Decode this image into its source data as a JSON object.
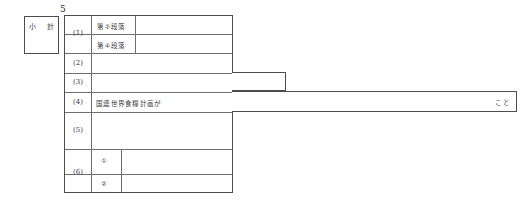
{
  "sheet": {
    "subtotal": {
      "label": "小  計"
    },
    "question_number": "5",
    "rows": [
      {
        "number": "(1)",
        "sub_rows": [
          {
            "label": "第②段落",
            "answer": ""
          },
          {
            "label": "第④段落",
            "answer": ""
          }
        ]
      },
      {
        "number": "(2)",
        "answer": ""
      },
      {
        "number": "(3)",
        "answer": "",
        "has_extension": true
      },
      {
        "number": "(4)",
        "answer": "国連世界食糧計画が",
        "extension_end": "こと",
        "has_extension": true
      },
      {
        "number": "(5)",
        "answer": ""
      },
      {
        "number": "(6)",
        "sub_rows": [
          {
            "label": "①",
            "answer": ""
          },
          {
            "label": "②",
            "answer": ""
          }
        ]
      }
    ]
  },
  "colors": {
    "border": "#4d4d4d",
    "inner_rule": "#6e6e6e",
    "text": "#3a3a3a",
    "background": "#ffffff"
  }
}
